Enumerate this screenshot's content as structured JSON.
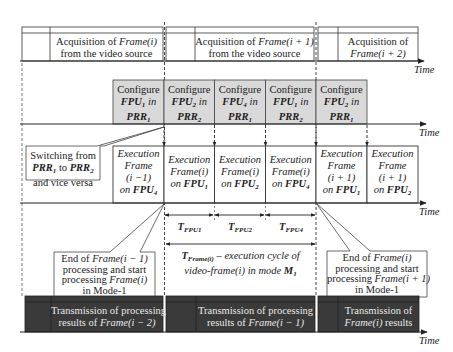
{
  "axes": {
    "time_label": "Time"
  },
  "acquisition_row": [
    {
      "line1_prefix": "Acquisition of ",
      "line1_frame": "Frame(i)",
      "line2": "from the video source"
    },
    {
      "line1_prefix": "Acquisition of ",
      "line1_frame": "Frame(i + 1)",
      "line2": "from the video source"
    },
    {
      "line1_prefix": "Acquisition of",
      "line1_frame": "",
      "line2_frame": "Frame(i + 2)"
    }
  ],
  "configure_row": [
    {
      "word": "Configure",
      "fpu": "FPU",
      "fpu_sub": "1",
      "in": " in",
      "prr": "PRR",
      "prr_sub": "1"
    },
    {
      "word": "Configure",
      "fpu": "FPU",
      "fpu_sub": "2",
      "in": " in",
      "prr": "PRR",
      "prr_sub": "2"
    },
    {
      "word": "Configure",
      "fpu": "FPU",
      "fpu_sub": "4",
      "in": " in",
      "prr": "PRR",
      "prr_sub": "1"
    },
    {
      "word": "Configure",
      "fpu": "FPU",
      "fpu_sub": "1",
      "in": " in",
      "prr": "PRR",
      "prr_sub": "2"
    },
    {
      "word": "Configure",
      "fpu": "FPU",
      "fpu_sub": "2",
      "in": " in",
      "prr": "PRR",
      "prr_sub": "1"
    }
  ],
  "execution_row": [
    {
      "l1": "Execution",
      "l2": "Frame",
      "l3": "(i −1)",
      "on": "on ",
      "fpu": "FPU",
      "fpu_sub": "4"
    },
    {
      "l1": "Execution",
      "l2": "Frame(i)",
      "l3": "",
      "on": "on ",
      "fpu": "FPU",
      "fpu_sub": "1"
    },
    {
      "l1": "Execution",
      "l2": "Frame(i)",
      "l3": "",
      "on": "on ",
      "fpu": "FPU",
      "fpu_sub": "2"
    },
    {
      "l1": "Execution",
      "l2": "Frame(i)",
      "l3": "",
      "on": "on ",
      "fpu": "FPU",
      "fpu_sub": "4"
    },
    {
      "l1": "Execution",
      "l2": "Frame",
      "l3": "(i + 1)",
      "on": "on ",
      "fpu": "FPU",
      "fpu_sub": "1"
    },
    {
      "l1": "Execution",
      "l2": "Frame",
      "l3": "(i + 1)",
      "on": "on ",
      "fpu": "FPU",
      "fpu_sub": "2"
    }
  ],
  "switch_callout": {
    "l1": "Switching from",
    "prr": "PRR",
    "sub1": "1",
    "to": " to ",
    "sub2": "2",
    "l3": "and vice versa"
  },
  "end_callout_left": {
    "l1a": "End of ",
    "l1b": "Frame(i − 1)",
    "l2": "processing and start",
    "l3a": "processing ",
    "l3b": "Frame(i)",
    "l4": "in Mode-1"
  },
  "end_callout_right": {
    "l1a": "End of ",
    "l1b": "Frame(i)",
    "l2": "processing and start",
    "l3a": "processing ",
    "l3b": "Frame(i + 1)",
    "l4": "in Mode-1"
  },
  "durations": [
    {
      "t": "T",
      "sub": "FPU1"
    },
    {
      "t": "T",
      "sub": "FPU2"
    },
    {
      "t": "T",
      "sub": "FPU4"
    }
  ],
  "cycle": {
    "t": "T",
    "sub": "Frame(i)",
    "rest": " – execution cycle of",
    "l2a": "video-frame(i) in mode ",
    "m": "M",
    "m_sub": "1"
  },
  "transmission_row": [
    {
      "l1": "Transmission of processing",
      "l2a": "results of ",
      "l2b": "Frame(i − 2)"
    },
    {
      "l1": "Transmission of processing",
      "l2a": "results of ",
      "l2b": "Frame(i − 1)"
    },
    {
      "l1": "Transmission of",
      "l2a": "",
      "l2b": "Frame(i)",
      "l2c": " results"
    }
  ],
  "colors": {
    "config_fill": "#d9d9d9",
    "transmission_fill": "#3a3a3a",
    "line": "#222222"
  }
}
